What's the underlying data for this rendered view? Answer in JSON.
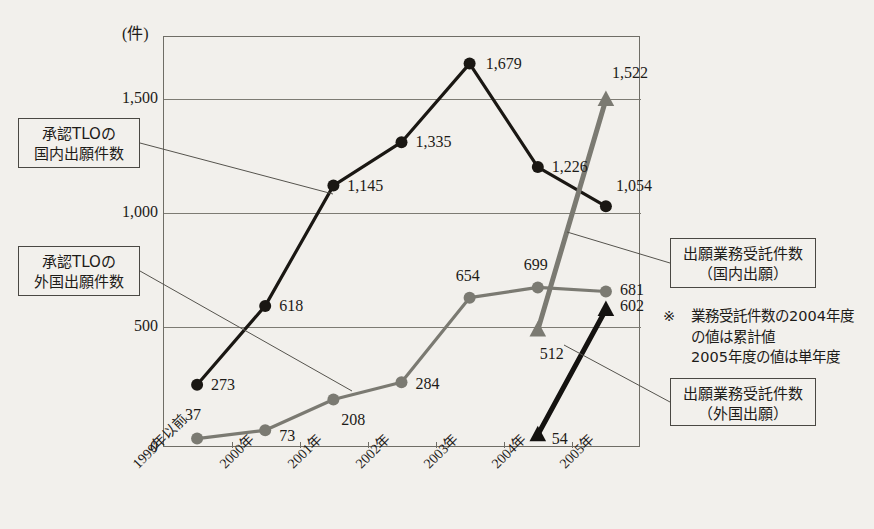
{
  "chart_data": {
    "type": "line",
    "title": "",
    "xlabel": "",
    "ylabel": "(件)",
    "unit_label": "(件)",
    "ylim": [
      0,
      1800
    ],
    "grid": true,
    "yticks": [
      0,
      500,
      1000,
      1500
    ],
    "ytick_labels": [
      "0",
      "500",
      "1,000",
      "1,500"
    ],
    "categories": [
      "1999年以前",
      "2000年",
      "2001年",
      "2002年",
      "2003年",
      "2004年",
      "2005年"
    ],
    "legend_position": "callout-boxes",
    "series": [
      {
        "name": "承認TLOの国内出願件数",
        "marker": "circle",
        "color": "#1a1713",
        "values": [
          273,
          618,
          1145,
          1335,
          1679,
          1226,
          1054
        ],
        "labels": [
          "273",
          "618",
          "1,145",
          "1,335",
          "1,679",
          "1,226",
          "1,054"
        ]
      },
      {
        "name": "承認TLOの外国出願件数",
        "marker": "circle",
        "color": "#7b7a72",
        "values": [
          37,
          73,
          208,
          284,
          654,
          699,
          681
        ],
        "labels": [
          "37",
          "73",
          "208",
          "284",
          "654",
          "699",
          "681"
        ]
      },
      {
        "name": "出願業務受託件数（国内出願）",
        "marker": "triangle",
        "color": "#7b7a72",
        "values": [
          null,
          null,
          null,
          null,
          null,
          512,
          1522
        ],
        "labels": [
          "",
          "",
          "",
          "",
          "",
          "512",
          "1,522"
        ]
      },
      {
        "name": "出願業務受託件数（外国出願）",
        "marker": "triangle",
        "color": "#141210",
        "values": [
          null,
          null,
          null,
          null,
          null,
          54,
          602
        ],
        "labels": [
          "",
          "",
          "",
          "",
          "",
          "54",
          "602"
        ]
      }
    ],
    "annotations": [
      {
        "id": "callout-tlo-domestic",
        "lines": [
          "承認TLOの",
          "国内出願件数"
        ],
        "side": "left"
      },
      {
        "id": "callout-tlo-foreign",
        "lines": [
          "承認TLOの",
          "外国出願件数"
        ],
        "side": "left"
      },
      {
        "id": "callout-contract-domestic",
        "lines": [
          "出願業務受託件数",
          "（国内出願）"
        ],
        "side": "right"
      },
      {
        "id": "callout-contract-foreign",
        "lines": [
          "出願業務受託件数",
          "（外国出願）"
        ],
        "side": "right"
      }
    ],
    "note": {
      "symbol": "※",
      "lines": [
        "業務受託件数の2004年度",
        "の値は累計値",
        "2005年度の値は単年度"
      ]
    }
  },
  "callouts": {
    "tlo_domestic": {
      "line1": "承認TLOの",
      "line2": "国内出願件数"
    },
    "tlo_foreign": {
      "line1": "承認TLOの",
      "line2": "外国出願件数"
    },
    "contract_domestic": {
      "line1": "出願業務受託件数",
      "line2": "（国内出願）"
    },
    "contract_foreign": {
      "line1": "出願業務受託件数",
      "line2": "（外国出願）"
    }
  },
  "note": {
    "symbol": "※",
    "line1": "業務受託件数の2004年度",
    "line2": "の値は累計値",
    "line3": "2005年度の値は単年度"
  },
  "axis": {
    "unit": "(件)",
    "y0": "0",
    "y500": "500",
    "y1000": "1,000",
    "y1500": "1,500",
    "x0": "1999年以前",
    "x1": "2000年",
    "x2": "2001年",
    "x3": "2002年",
    "x4": "2003年",
    "x5": "2004年",
    "x6": "2005年"
  },
  "values": {
    "s1_0": "273",
    "s1_1": "618",
    "s1_2": "1,145",
    "s1_3": "1,335",
    "s1_4": "1,679",
    "s1_5": "1,226",
    "s1_6": "1,054",
    "s2_0": "37",
    "s2_1": "73",
    "s2_2": "208",
    "s2_3": "284",
    "s2_4": "654",
    "s2_5": "699",
    "s2_6": "681",
    "s3_5": "512",
    "s3_6": "1,522",
    "s4_5": "54",
    "s4_6": "602"
  },
  "colors": {
    "dark": "#1a1713",
    "gray": "#7b7a72",
    "frame": "#6f6d66",
    "background": "#f2f0ec"
  }
}
